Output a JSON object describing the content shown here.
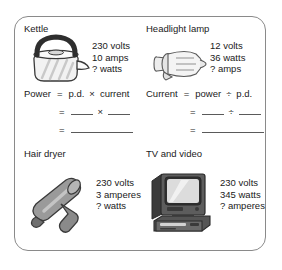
{
  "worksheet": {
    "items": [
      {
        "id": "kettle",
        "title": "Kettle",
        "icon": "kettle-icon",
        "specs": [
          "230 volts",
          "10 amps",
          "? watts"
        ]
      },
      {
        "id": "headlight-lamp",
        "title": "Headlight lamp",
        "icon": "headlight-lamp-icon",
        "specs": [
          "12 volts",
          "36 watts",
          "? amps"
        ]
      },
      {
        "id": "hair-dryer",
        "title": "Hair dryer",
        "icon": "hair-dryer-icon",
        "specs": [
          "230 volts",
          "3 amperes",
          "? watts"
        ]
      },
      {
        "id": "tv-and-video",
        "title": "TV and video",
        "icon": "television-icon",
        "specs": [
          "230 volts",
          "345 watts",
          "? amperes"
        ]
      }
    ],
    "formulas": [
      {
        "id": "power",
        "quantity": "Power",
        "equals": "=",
        "left_term": "p.d.",
        "operator": "×",
        "right_term": "current"
      },
      {
        "id": "current",
        "quantity": "Current",
        "equals": "=",
        "left_term": "power",
        "operator": "÷",
        "right_term": "p.d."
      }
    ]
  },
  "colors": {
    "border": "#8a8a8a",
    "text": "#1a1a1a",
    "rule": "#5a5a5a",
    "dark_fill": "#2e2e2e",
    "mid_fill": "#8d8d8d",
    "light_fill": "#e2e2e2"
  }
}
